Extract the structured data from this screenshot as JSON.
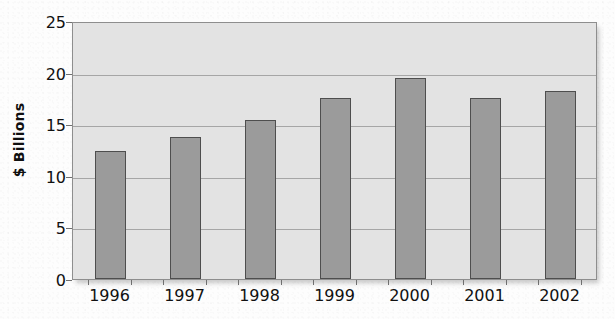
{
  "chart_data": {
    "type": "bar",
    "title": "",
    "xlabel": "",
    "ylabel": "$ Billions",
    "categories": [
      "1996",
      "1997",
      "1998",
      "1999",
      "2000",
      "2001",
      "2002"
    ],
    "values": [
      12.4,
      13.8,
      15.4,
      17.5,
      19.5,
      17.5,
      18.2
    ],
    "ylim": [
      0,
      25
    ],
    "ytick_labels": [
      "0",
      "5",
      "10",
      "15",
      "20",
      "25"
    ],
    "ytick_values": [
      0,
      5,
      10,
      15,
      20,
      25
    ],
    "grid": true,
    "legend": false,
    "legend_position": "none",
    "colors": {
      "bar_fill": "#9b9b9b",
      "bar_stroke": "#4e4e4e",
      "plot_background": "#e3e3e3",
      "gridline": "#a6a6a6",
      "axis": "#8e8e8e",
      "text": "#111111",
      "page_background": "#fdfdfd"
    }
  }
}
